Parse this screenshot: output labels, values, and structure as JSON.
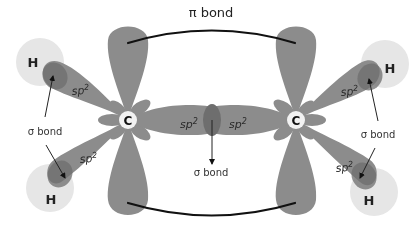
{
  "diagram": {
    "colors": {
      "orbital": "#8c8c8c",
      "orbital_overlap": "#6e6e6e",
      "hydrogen": "#e6e6e6",
      "carbon_center": "#f2f2f2",
      "line": "#111111",
      "background": "#ffffff"
    },
    "labels": {
      "pi_bond": "π bond",
      "sigma_bond": "σ bond",
      "sp2_base": "sp",
      "sp2_sup": "2",
      "carbon": "C",
      "hydrogen": "H"
    },
    "atoms": [
      {
        "id": "C1",
        "symbol": "C",
        "x": 128,
        "y": 120
      },
      {
        "id": "C2",
        "symbol": "C",
        "x": 296,
        "y": 120
      },
      {
        "id": "H1",
        "symbol": "H",
        "x": 40,
        "y": 62
      },
      {
        "id": "H2",
        "symbol": "H",
        "x": 50,
        "y": 188
      },
      {
        "id": "H3",
        "symbol": "H",
        "x": 385,
        "y": 65
      },
      {
        "id": "H4",
        "symbol": "H",
        "x": 373,
        "y": 192
      }
    ],
    "annotations": [
      {
        "text": "π bond",
        "x": 210,
        "y": 16
      },
      {
        "text": "σ bond",
        "x": 38,
        "y": 131,
        "refers_to": [
          "C1-H1",
          "C1-H2"
        ]
      },
      {
        "text": "σ bond",
        "x": 210,
        "y": 183,
        "refers_to": [
          "C1-C2"
        ]
      },
      {
        "text": "σ bond",
        "x": 378,
        "y": 136,
        "refers_to": [
          "C2-H3",
          "C2-H4"
        ]
      }
    ]
  }
}
